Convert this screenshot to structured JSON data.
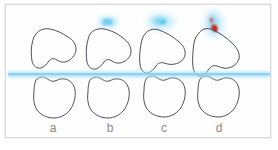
{
  "figure": {
    "type": "anatomical-outline-diagram",
    "background_color": "#ffffff",
    "frame_color": "#d8d8d8",
    "outline_color": "#3a3a46",
    "band_color": "#9fdcf2",
    "blob_cyan_color": "#7fd4f0",
    "blob_red_color": "#d9231f",
    "label_color": "#8a8a8a",
    "width": 278,
    "height": 150
  },
  "panels": [
    {
      "id": "a",
      "label": "a",
      "label_x": 53,
      "label_y": 128,
      "upper_shape_name": "upper-bone-outline-a",
      "lower_shape_name": "lower-bone-outline-a",
      "displacement": "none",
      "marker": "none"
    },
    {
      "id": "b",
      "label": "b",
      "label_x": 110,
      "label_y": 128,
      "upper_shape_name": "upper-bone-outline-b",
      "lower_shape_name": "lower-bone-outline-b",
      "displacement": "slight",
      "marker": "cyan-blob-small"
    },
    {
      "id": "c",
      "label": "c",
      "label_x": 164,
      "label_y": 128,
      "upper_shape_name": "upper-bone-outline-c",
      "lower_shape_name": "lower-bone-outline-c",
      "displacement": "moderate",
      "marker": "cyan-blob-large"
    },
    {
      "id": "d",
      "label": "d",
      "label_x": 219,
      "label_y": 128,
      "upper_shape_name": "upper-bone-outline-d",
      "lower_shape_name": "lower-bone-outline-d",
      "displacement": "severe",
      "marker": "red-cyan-blob"
    }
  ],
  "band": {
    "name": "horizontal-reference-band",
    "x": 8,
    "y": 71,
    "width": 262,
    "height": 7,
    "color": "#9fdcf2"
  },
  "markers": [
    {
      "name": "cyan-blob-above-b",
      "cx": 108,
      "cy": 22,
      "rx": 9,
      "ry": 5,
      "color": "#7fd4f0"
    },
    {
      "name": "cyan-blob-above-c",
      "cx": 161,
      "cy": 22,
      "rx": 13,
      "ry": 7,
      "color": "#7fd4f0"
    },
    {
      "name": "red-blob-above-d",
      "cx": 214,
      "cy": 24,
      "rx": 9,
      "ry": 13,
      "color": "#d9231f"
    }
  ]
}
